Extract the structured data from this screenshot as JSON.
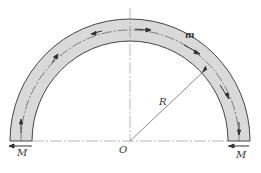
{
  "diagram": {
    "type": "semicircular curved beam / ring segment under end moments",
    "colors": {
      "ring_fill": "#d9d9d9",
      "stroke": "#444444",
      "axis": "#777777"
    },
    "labels": {
      "moment_left": "M",
      "moment_right": "M",
      "center": "O",
      "radius": "R",
      "element": "m"
    },
    "geometry": {
      "center": [
        130,
        141
      ],
      "outer_radius": 120,
      "inner_radius": 98,
      "mid_radius": 109
    }
  }
}
